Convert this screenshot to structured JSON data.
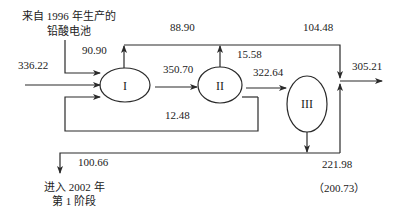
{
  "diagram": {
    "type": "material-flow",
    "nodes": [
      {
        "id": "I",
        "label": "I"
      },
      {
        "id": "II",
        "label": "II"
      },
      {
        "id": "III",
        "label": "III"
      }
    ],
    "labels": {
      "source_text_line1": "来自 1996 年生产的",
      "source_text_line2": "铅酸电池",
      "output_text_line1": "进入 2002 年",
      "output_text_line2": "第 1 阶段"
    },
    "flows": {
      "input_main": "336.22",
      "input_source": "90.90",
      "top_from_I": "88.90",
      "top_right": "104.48",
      "up_from_II": "15.58",
      "I_to_II": "350.70",
      "II_to_III": "322.64",
      "recycle_to_I": "12.48",
      "output_right": "305.21",
      "to_2002": "100.66",
      "from_III_down": "221.98",
      "from_III_paren": "（200.73）"
    },
    "colors": {
      "line": "#2a2a2a",
      "text": "#222222",
      "background": "#ffffff"
    }
  }
}
